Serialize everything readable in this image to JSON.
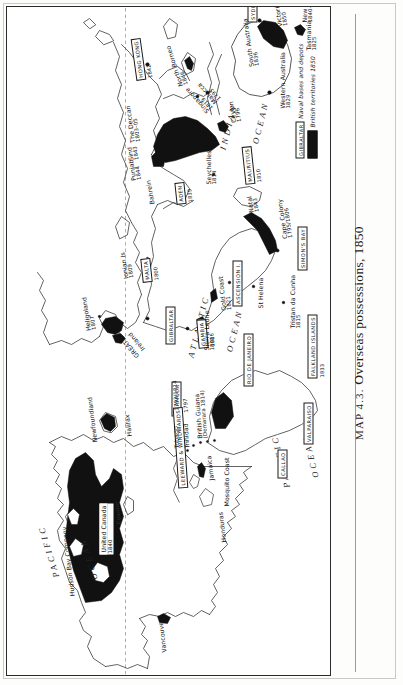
{
  "caption": {
    "prefix": "MAP 4.3.",
    "title": "Overseas possessions, 1850",
    "full": "MAP 4.3.  Overseas possessions, 1850"
  },
  "legend": {
    "naval_key": "GIBRALTAR",
    "naval_text": "Naval bases and depots",
    "territory_text": "British territories 1850",
    "territory_color": "#111111"
  },
  "oceans": [
    {
      "name": "PACIFIC",
      "id": "pacific-north"
    },
    {
      "name": "OCEAN",
      "id": "pacific-north-ocean"
    },
    {
      "name": "INDIAN",
      "id": "indian"
    },
    {
      "name": "OCEAN",
      "id": "indian-ocean"
    },
    {
      "name": "ATLANTIC",
      "id": "atlantic"
    },
    {
      "name": "OCEAN",
      "id": "atlantic-ocean"
    },
    {
      "name": "PACIFIC",
      "id": "pacific-south"
    },
    {
      "name": "OCEAN",
      "id": "pacific-south-ocean"
    }
  ],
  "equator_label": "Equator",
  "naval_bases": [
    {
      "name": "HONG KONG",
      "date": "1842"
    },
    {
      "name": "SYDNEY",
      "date": ""
    },
    {
      "name": "ADEN",
      "date": "1839"
    },
    {
      "name": "MALTA",
      "date": "1800"
    },
    {
      "name": "GIBRALTAR",
      "date": ""
    },
    {
      "name": "BERMUDA",
      "date": ""
    },
    {
      "name": "GAMBIA",
      "date": "1816"
    },
    {
      "name": "ASCENSION I.",
      "date": ""
    },
    {
      "name": "SIMON'S BAY",
      "date": ""
    },
    {
      "name": "MAURITIUS",
      "date": "1810"
    },
    {
      "name": "RIO DE JANEIRO",
      "date": ""
    },
    {
      "name": "VALPARAISO",
      "date": ""
    },
    {
      "name": "CALLAO",
      "date": ""
    },
    {
      "name": "FALKLAND ISLANDS",
      "date": "1833"
    },
    {
      "name": "LEEWARD & WINDWARDS",
      "date": ""
    }
  ],
  "territories": [
    {
      "name": "Hudson Bay Company",
      "date": ""
    },
    {
      "name": "United Canada",
      "date": "1840"
    },
    {
      "name": "Newfoundland",
      "date": ""
    },
    {
      "name": "Halifax",
      "date": ""
    },
    {
      "name": "Vancouver",
      "date": ""
    },
    {
      "name": "Honduras",
      "date": ""
    },
    {
      "name": "Mosquito Coast",
      "date": ""
    },
    {
      "name": "Jamaica",
      "date": ""
    },
    {
      "name": "Tobago",
      "date": "1793/1814"
    },
    {
      "name": "Trinidad",
      "date": "1797"
    },
    {
      "name": "British Guiana",
      "date": "(Demarara 1814)"
    },
    {
      "name": "GREAT BRITAIN",
      "date": ""
    },
    {
      "name": "Ireland",
      "date": ""
    },
    {
      "name": "Heligoland",
      "date": "1807"
    },
    {
      "name": "Ionian Is",
      "date": "1809"
    },
    {
      "name": "Bahrein",
      "date": ""
    },
    {
      "name": "Sierra Leone",
      "date": "1808"
    },
    {
      "name": "Gold Coast",
      "date": "1821"
    },
    {
      "name": "St Helena",
      "date": ""
    },
    {
      "name": "Tristan da Cunha",
      "date": "1815"
    },
    {
      "name": "Cape Colony",
      "date": "1795/1806"
    },
    {
      "name": "Natal",
      "date": "1843"
    },
    {
      "name": "Seychelles",
      "date": "1814"
    },
    {
      "name": "Punjab",
      "date": "1844"
    },
    {
      "name": "Sind",
      "date": "1843"
    },
    {
      "name": "The Deccan",
      "date": "1803–05"
    },
    {
      "name": "Ceylon",
      "date": "1796"
    },
    {
      "name": "Malacca",
      "date": "1795"
    },
    {
      "name": "Singapore",
      "date": "1819"
    },
    {
      "name": "North Borneo",
      "date": "1846"
    },
    {
      "name": "Western Australia",
      "date": "1829"
    },
    {
      "name": "South Australia",
      "date": "1836"
    },
    {
      "name": "Victoria",
      "date": "1850"
    },
    {
      "name": "Tasmania",
      "date": "1825"
    },
    {
      "name": "New Zealand",
      "date": "1840–41"
    }
  ]
}
